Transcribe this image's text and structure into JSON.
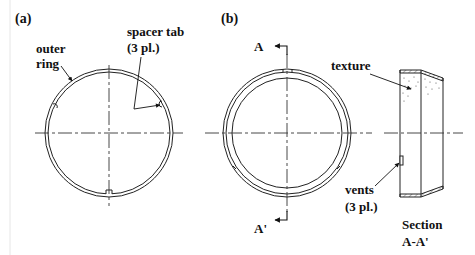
{
  "panels": {
    "a": {
      "label": "(a)",
      "callouts": {
        "outer_ring": {
          "line1": "outer",
          "line2": "ring"
        },
        "spacer_tab": {
          "line1": "spacer tab",
          "line2": "(3 pl.)"
        }
      }
    },
    "b": {
      "label": "(b)",
      "section_marks": {
        "top": "A",
        "bottom": "A'"
      },
      "callouts": {
        "texture": {
          "line1": "texture"
        },
        "vents": {
          "line1": "vents",
          "line2": "(3 pl.)"
        }
      },
      "section_title": {
        "line1": "Section",
        "line2": "A-A'"
      }
    }
  },
  "colors": {
    "stroke": "#222222",
    "centerline": "#333333",
    "background": "#ffffff"
  }
}
